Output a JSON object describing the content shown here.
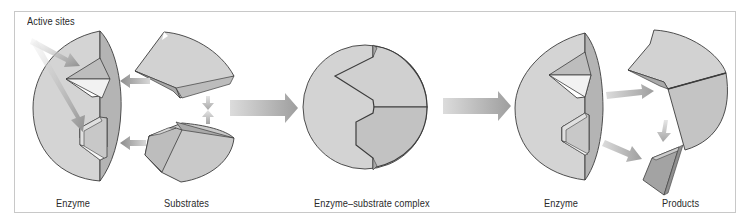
{
  "diagram": {
    "type": "enzyme-substrate-reaction",
    "labels": {
      "active_sites": "Active sites",
      "enzyme_left": "Enzyme",
      "substrates": "Substrates",
      "complex": "Enzyme–substrate complex",
      "enzyme_right": "Enzyme",
      "products": "Products"
    },
    "stages": [
      {
        "id": "reactants",
        "components": [
          "Enzyme",
          "Substrates"
        ]
      },
      {
        "id": "complex",
        "components": [
          "Enzyme–substrate complex"
        ]
      },
      {
        "id": "result",
        "components": [
          "Enzyme",
          "Products"
        ]
      }
    ],
    "colors": {
      "fill_light": "#d6d6d6",
      "fill_mid": "#c4c4c4",
      "fill_dark": "#a9a9a9",
      "outline": "#3c3c3c",
      "arrow": "#a4a4a4",
      "frame": "#c8c8c8"
    }
  }
}
